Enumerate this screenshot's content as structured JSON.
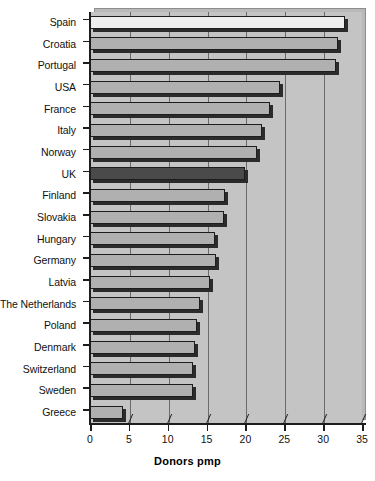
{
  "chart_data": {
    "type": "bar",
    "orientation": "horizontal",
    "title": "",
    "xlabel": "Donors pmp",
    "ylabel": "",
    "xlim": [
      0,
      35
    ],
    "ylim": null,
    "grid": true,
    "legend": null,
    "x_ticks": [
      0,
      5,
      10,
      15,
      20,
      25,
      30,
      35
    ],
    "x_tick_labels": [
      "0",
      "5",
      "10",
      "15",
      "20",
      "25",
      "30",
      "35"
    ],
    "categories": [
      "Spain",
      "Croatia",
      "Portugal",
      "USA",
      "France",
      "Italy",
      "Norway",
      "UK",
      "Finland",
      "Slovakia",
      "Hungary",
      "Germany",
      "Latvia",
      "The Netherlands",
      "Poland",
      "Denmark",
      "Switzerland",
      "Sweden",
      "Greece"
    ],
    "values": [
      32.8,
      31.9,
      31.6,
      24.4,
      23.2,
      22.1,
      21.5,
      20.0,
      17.4,
      17.3,
      16.1,
      16.2,
      15.5,
      14.2,
      13.8,
      13.5,
      13.3,
      13.2,
      4.2
    ],
    "highlight_category": "UK",
    "colors": {
      "bar_default": "#b0b0b0",
      "bar_light": "#eeeeee",
      "bar_highlight": "#4a4a4a",
      "bar_outline": "#1d1d1d",
      "plot_background": "#c4c4c4",
      "plot_depth": "#b9b9b9",
      "gridline": "#6a6a6a",
      "axis": "#1d1d1d",
      "text": "#111111",
      "page_background": "#ffffff"
    },
    "bar_styles": [
      "light",
      "default",
      "default",
      "default",
      "default",
      "default",
      "default",
      "dark",
      "default",
      "default",
      "default",
      "default",
      "default",
      "default",
      "default",
      "default",
      "default",
      "default",
      "default"
    ]
  }
}
